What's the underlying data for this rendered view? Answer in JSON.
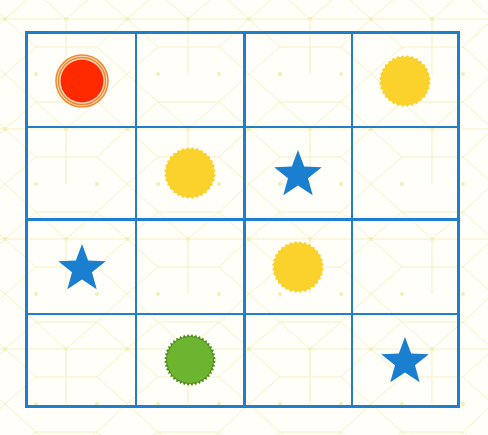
{
  "puzzle": {
    "type": "4x4 symbol sudoku",
    "rows": 4,
    "cols": 4,
    "colors": {
      "grid": "#1f7fcc",
      "background": "#fffef8",
      "pattern": "#f4f1c4",
      "sun": "#fbd22b",
      "star": "#1a7fcf",
      "red_circle": "#ff2a00",
      "red_ring": "#f08a30",
      "green_circle": "#6db531",
      "green_edge": "#4d8f1e"
    },
    "cells": [
      [
        "red-circle",
        "",
        "",
        "sun"
      ],
      [
        "",
        "sun",
        "star",
        ""
      ],
      [
        "star",
        "",
        "sun",
        ""
      ],
      [
        "",
        "green-circle",
        "",
        "star"
      ]
    ]
  }
}
